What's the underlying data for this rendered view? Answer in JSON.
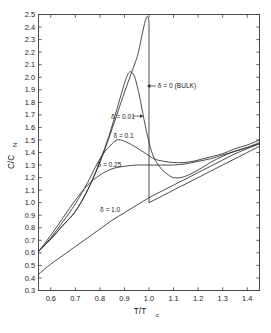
{
  "chart_data": {
    "type": "line",
    "title": "",
    "subtitle": "",
    "xlabel": "T/T",
    "xlabel_sub": "c",
    "ylabel": "C/C",
    "ylabel_sub": "N",
    "xlim": [
      0.55,
      1.45
    ],
    "ylim": [
      0.3,
      2.5
    ],
    "grid": false,
    "legend_position": "inline-annotations",
    "xticks": [
      "0.6",
      "0.7",
      "0.8",
      "0.9",
      "1.0",
      "1.1",
      "1.2",
      "1.3",
      "1.4"
    ],
    "xtick_values": [
      0.6,
      0.7,
      0.8,
      0.9,
      1.0,
      1.1,
      1.2,
      1.3,
      1.4
    ],
    "yticks": [
      "0.3",
      "0.4",
      "0.5",
      "0.6",
      "0.7",
      "0.8",
      "0.9",
      "1.0",
      "1.1",
      "1.2",
      "1.3",
      "1.4",
      "1.5",
      "1.6",
      "1.7",
      "1.8",
      "1.9",
      "2.0",
      "2.1",
      "2.2",
      "2.3",
      "2.4",
      "2.5"
    ],
    "ytick_values": [
      0.3,
      0.4,
      0.5,
      0.6,
      0.7,
      0.8,
      0.9,
      1.0,
      1.1,
      1.2,
      1.3,
      1.4,
      1.5,
      1.6,
      1.7,
      1.8,
      1.9,
      2.0,
      2.1,
      2.2,
      2.3,
      2.4,
      2.5
    ],
    "series": [
      {
        "name": "delta = 0 (BULK)",
        "label": "δ = 0 (BULK)",
        "x": [
          0.55,
          0.6,
          0.65,
          0.7,
          0.75,
          0.8,
          0.85,
          0.9,
          0.95,
          1.0,
          1.0,
          1.02,
          1.06,
          1.1,
          1.15,
          1.2,
          1.25,
          1.3,
          1.35,
          1.4,
          1.45
        ],
        "y": [
          0.61,
          0.71,
          0.82,
          0.93,
          1.1,
          1.32,
          1.59,
          1.88,
          2.15,
          2.43,
          1.0,
          1.02,
          1.06,
          1.1,
          1.15,
          1.2,
          1.25,
          1.3,
          1.35,
          1.4,
          1.45
        ]
      },
      {
        "name": "delta = 0.01",
        "label": "δ = 0.01",
        "x": [
          0.55,
          0.6,
          0.65,
          0.7,
          0.75,
          0.8,
          0.84,
          0.87,
          0.9,
          0.92,
          0.94,
          0.96,
          0.98,
          1.0,
          1.02,
          1.05,
          1.08,
          1.1,
          1.13,
          1.16,
          1.2,
          1.25,
          1.3,
          1.35,
          1.4,
          1.45
        ],
        "y": [
          0.61,
          0.71,
          0.82,
          0.93,
          1.1,
          1.33,
          1.55,
          1.75,
          1.95,
          2.04,
          2.01,
          1.86,
          1.66,
          1.48,
          1.36,
          1.27,
          1.22,
          1.2,
          1.2,
          1.22,
          1.26,
          1.32,
          1.37,
          1.41,
          1.44,
          1.47
        ]
      },
      {
        "name": "delta = 0.1",
        "label": "δ = 0.1",
        "x": [
          0.55,
          0.6,
          0.65,
          0.7,
          0.75,
          0.8,
          0.84,
          0.87,
          0.9,
          0.94,
          0.98,
          1.02,
          1.06,
          1.1,
          1.14,
          1.18,
          1.22,
          1.26,
          1.3,
          1.35,
          1.4,
          1.45
        ],
        "y": [
          0.61,
          0.72,
          0.85,
          0.99,
          1.16,
          1.35,
          1.45,
          1.5,
          1.49,
          1.45,
          1.4,
          1.35,
          1.33,
          1.32,
          1.32,
          1.33,
          1.35,
          1.37,
          1.39,
          1.43,
          1.46,
          1.5
        ]
      },
      {
        "name": "delta = 0.25",
        "label": "δ = 0.25",
        "x": [
          0.55,
          0.6,
          0.65,
          0.7,
          0.75,
          0.8,
          0.85,
          0.9,
          0.95,
          1.0,
          1.05,
          1.1,
          1.15,
          1.2,
          1.25,
          1.3,
          1.35,
          1.4,
          1.45
        ],
        "y": [
          0.61,
          0.74,
          0.88,
          1.02,
          1.14,
          1.22,
          1.27,
          1.29,
          1.3,
          1.3,
          1.3,
          1.3,
          1.31,
          1.33,
          1.35,
          1.38,
          1.41,
          1.44,
          1.48
        ]
      },
      {
        "name": "delta = 1.0",
        "label": "δ = 1.0",
        "x": [
          0.55,
          0.6,
          0.65,
          0.7,
          0.75,
          0.8,
          0.85,
          0.9,
          0.95,
          1.0,
          1.05,
          1.1,
          1.15,
          1.2,
          1.25,
          1.3,
          1.35,
          1.4,
          1.45
        ],
        "y": [
          0.43,
          0.51,
          0.58,
          0.65,
          0.72,
          0.79,
          0.86,
          0.92,
          0.98,
          1.04,
          1.09,
          1.14,
          1.19,
          1.24,
          1.29,
          1.34,
          1.39,
          1.43,
          1.47
        ]
      }
    ],
    "annotations": [
      {
        "name": "annotation-delta-0",
        "text": "δ = 0 (BULK)",
        "x": 1.03,
        "y": 1.93,
        "arrow": "left"
      },
      {
        "name": "annotation-delta-001",
        "text": "δ = 0.01",
        "x": 0.845,
        "y": 1.69,
        "arrow": "right"
      },
      {
        "name": "annotation-delta-01",
        "text": "δ = 0.1",
        "x": 0.855,
        "y": 1.535,
        "arrow": "none"
      },
      {
        "name": "annotation-delta-025",
        "text": "δ = 0.25",
        "x": 0.79,
        "y": 1.305,
        "arrow": "none"
      },
      {
        "name": "annotation-delta-10",
        "text": "δ = 1.0",
        "x": 0.8,
        "y": 0.945,
        "arrow": "none"
      }
    ]
  },
  "colors": {
    "curve": "#2b2b2b",
    "axis": "#3a3a3a",
    "text": "#1a1a1a",
    "background": "#ffffff"
  }
}
